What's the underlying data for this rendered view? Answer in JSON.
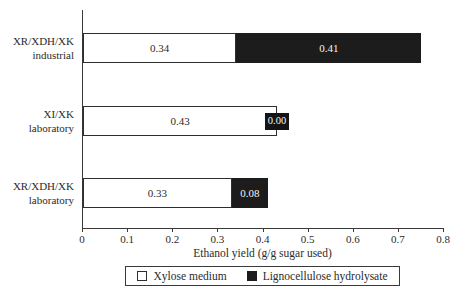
{
  "chart_data": {
    "type": "bar",
    "orientation": "horizontal",
    "stacked": true,
    "title": "",
    "xlabel": "Ethanol yield (g/g sugar used)",
    "xlim": [
      0,
      0.8
    ],
    "xticks": [
      "0",
      "0.1",
      "0.2",
      "0.3",
      "0.4",
      "0.5",
      "0.6",
      "0.7",
      "0.8"
    ],
    "categories": [
      {
        "lines": [
          "XR/XDH/XK",
          "industrial"
        ]
      },
      {
        "lines": [
          "XI/XK",
          "laboratory"
        ]
      },
      {
        "lines": [
          "XR/XDH/XK",
          "laboratory"
        ]
      }
    ],
    "series": [
      {
        "name": "Xylose medium",
        "swatch": "white",
        "color": "#ffffff",
        "values": [
          0.34,
          0.43,
          0.33
        ],
        "labels": [
          "0.34",
          "0.43",
          "0.33"
        ]
      },
      {
        "name": "Lignocellulose hydrolysate",
        "swatch": "black",
        "color": "#1c1c1c",
        "values": [
          0.41,
          0.0,
          0.08
        ],
        "labels": [
          "0.41",
          "0.00",
          "0.08"
        ]
      }
    ],
    "legend_position": "bottom",
    "grid": false
  },
  "colors": {
    "ink": "#2b2b2b",
    "bar_black": "#1c1c1c",
    "background": "#ffffff"
  }
}
